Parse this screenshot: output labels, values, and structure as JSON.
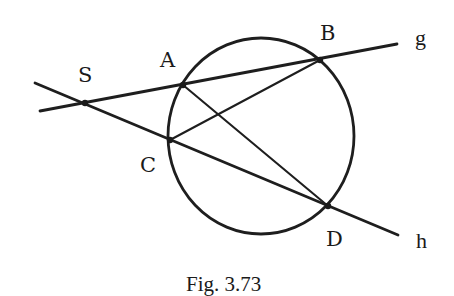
{
  "figure": {
    "caption": "Fig. 3.73",
    "colors": {
      "ink": "#1e1e1e",
      "background": "#ffffff"
    },
    "circle": {
      "cx": 261,
      "cy": 136,
      "rx": 93,
      "ry": 98
    },
    "lines": [
      {
        "name": "g",
        "label": "g",
        "from": [
          40,
          111
        ],
        "to": [
          397,
          44
        ]
      },
      {
        "name": "h",
        "label": "h",
        "from": [
          35,
          83
        ],
        "to": [
          398,
          235
        ]
      }
    ],
    "chords": [
      {
        "name": "AD",
        "from": "A",
        "to": "D"
      },
      {
        "name": "CB",
        "from": "C",
        "to": "B"
      }
    ],
    "points": {
      "S": {
        "label": "S",
        "x": 85,
        "y": 103
      },
      "A": {
        "label": "A",
        "x": 183,
        "y": 85
      },
      "B": {
        "label": "B",
        "x": 320,
        "y": 60
      },
      "C": {
        "label": "C",
        "x": 170,
        "y": 140
      },
      "D": {
        "label": "D",
        "x": 328,
        "y": 206
      }
    },
    "line_labels": {
      "g": "g",
      "h": "h"
    }
  }
}
